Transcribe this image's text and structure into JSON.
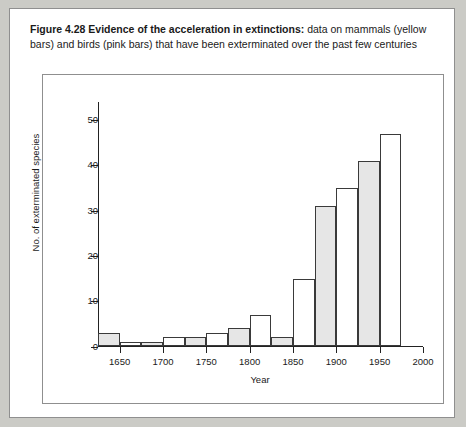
{
  "caption": {
    "lead": "Figure 4.28  Evidence of the acceleration in extinctions:",
    "rest": " data on mammals (yellow bars) and birds (pink bars) that have been exterminated over the past few centuries"
  },
  "colors": {
    "page_background": "#cbcbc6",
    "card_background": "#ffffff",
    "axis": "#222222",
    "mammal_bar_fill": "#e6e6e6",
    "bird_bar_fill": "#ffffff",
    "bar_stroke": "#3a3a3a"
  },
  "chart_data": {
    "type": "bar",
    "title": "Evidence of the acceleration in extinctions",
    "xlabel": "Year",
    "ylabel": "No. of exterminated species",
    "xlim": [
      1625,
      2000
    ],
    "ylim": [
      0,
      54
    ],
    "xticks": [
      1650,
      1700,
      1750,
      1800,
      1850,
      1900,
      1950,
      2000
    ],
    "yticks": [
      0,
      10,
      20,
      30,
      40,
      50
    ],
    "grid": false,
    "legend_position": "none",
    "bin_width_years": 25,
    "bins": [
      {
        "start": 1625,
        "end": 1650,
        "group": "mammals",
        "value": 3
      },
      {
        "start": 1650,
        "end": 1675,
        "group": "birds",
        "value": 1
      },
      {
        "start": 1675,
        "end": 1700,
        "group": "mammals",
        "value": 1
      },
      {
        "start": 1700,
        "end": 1725,
        "group": "birds",
        "value": 2
      },
      {
        "start": 1725,
        "end": 1750,
        "group": "mammals",
        "value": 2
      },
      {
        "start": 1750,
        "end": 1775,
        "group": "birds",
        "value": 3
      },
      {
        "start": 1775,
        "end": 1800,
        "group": "mammals",
        "value": 4
      },
      {
        "start": 1800,
        "end": 1825,
        "group": "birds",
        "value": 7
      },
      {
        "start": 1825,
        "end": 1850,
        "group": "mammals",
        "value": 2
      },
      {
        "start": 1850,
        "end": 1875,
        "group": "birds",
        "value": 15
      },
      {
        "start": 1875,
        "end": 1900,
        "group": "mammals",
        "value": 31
      },
      {
        "start": 1900,
        "end": 1925,
        "group": "birds",
        "value": 35
      },
      {
        "start": 1925,
        "end": 1950,
        "group": "mammals",
        "value": 41
      },
      {
        "start": 1950,
        "end": 1975,
        "group": "birds",
        "value": 47
      }
    ],
    "series": [
      {
        "name": "mammals (yellow bars)",
        "values": [
          3,
          1,
          2,
          4,
          2,
          31,
          41
        ]
      },
      {
        "name": "birds (pink bars)",
        "values": [
          1,
          2,
          3,
          7,
          15,
          35,
          47
        ]
      }
    ]
  }
}
